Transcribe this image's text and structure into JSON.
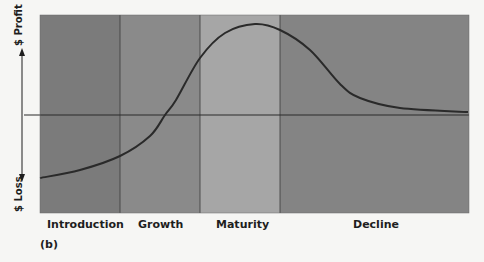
{
  "figure_label": "(b)",
  "y_axis": {
    "positive_label": "$ Profit",
    "negative_label": "$ Loss"
  },
  "stages": [
    {
      "label": "Introduction",
      "x_start": 40,
      "x_end": 120,
      "color": "#7b7b7b"
    },
    {
      "label": "Growth",
      "x_start": 120,
      "x_end": 200,
      "color": "#8a8a8a"
    },
    {
      "label": "Maturity",
      "x_start": 200,
      "x_end": 280,
      "color": "#a6a6a6"
    },
    {
      "label": "Decline",
      "x_start": 280,
      "x_end": 469,
      "color": "#848484"
    }
  ],
  "colors": {
    "curve": "#2a2a2a",
    "axis": "#2a2a2a",
    "background": "#f6f6f4"
  },
  "chart_data": {
    "type": "line",
    "xlabel": "",
    "ylabel": "$ Loss / $ Profit",
    "categories": [
      "Introduction",
      "Growth",
      "Maturity",
      "Decline"
    ],
    "series": [
      {
        "name": "Profit",
        "points_px": [
          [
            40,
            178
          ],
          [
            80,
            170
          ],
          [
            120,
            156
          ],
          [
            150,
            136
          ],
          [
            165,
            115
          ],
          [
            176,
            100
          ],
          [
            200,
            58
          ],
          [
            225,
            33
          ],
          [
            255,
            24
          ],
          [
            280,
            30
          ],
          [
            310,
            50
          ],
          [
            340,
            84
          ],
          [
            360,
            98
          ],
          [
            400,
            108
          ],
          [
            468,
            112
          ]
        ]
      }
    ],
    "zero_line_y_px": 115
  }
}
